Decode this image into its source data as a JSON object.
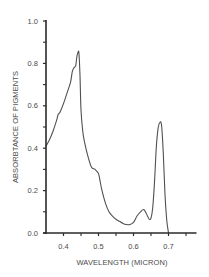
{
  "chart_data": {
    "type": "line",
    "title": "",
    "xlabel": "WAVELENGTH (MICRON)",
    "ylabel": "ABSORBTANCE OF PIGMENTS",
    "xlim": [
      0.35,
      0.78
    ],
    "ylim": [
      0.0,
      1.0
    ],
    "x_ticks": [
      0.4,
      0.5,
      0.6,
      0.7
    ],
    "x_tick_labels": [
      "0.4",
      "0.5",
      "0.6",
      "0.7"
    ],
    "x_minor_ticks": [
      0.45,
      0.55,
      0.65,
      0.75
    ],
    "y_ticks": [
      0.0,
      0.2,
      0.4,
      0.6,
      0.8,
      1.0
    ],
    "y_tick_labels": [
      "0.0",
      "0.2",
      "0.4",
      "0.6",
      "0.8",
      "1.0"
    ],
    "y_minor_ticks": [
      0.1,
      0.3,
      0.5,
      0.7,
      0.9
    ],
    "grid": false,
    "legend": null,
    "series": [
      {
        "name": "Pigment absorbtance",
        "x": [
          0.35,
          0.36,
          0.37,
          0.38,
          0.385,
          0.39,
          0.4,
          0.41,
          0.42,
          0.425,
          0.43,
          0.435,
          0.438,
          0.441,
          0.444,
          0.447,
          0.45,
          0.455,
          0.46,
          0.47,
          0.48,
          0.49,
          0.5,
          0.505,
          0.51,
          0.52,
          0.53,
          0.54,
          0.55,
          0.56,
          0.57,
          0.58,
          0.59,
          0.6,
          0.61,
          0.62,
          0.63,
          0.64,
          0.645,
          0.65,
          0.655,
          0.66,
          0.665,
          0.67,
          0.675,
          0.68,
          0.685,
          0.69,
          0.695,
          0.7
        ],
        "y": [
          0.41,
          0.44,
          0.48,
          0.53,
          0.56,
          0.57,
          0.61,
          0.66,
          0.71,
          0.76,
          0.78,
          0.79,
          0.83,
          0.85,
          0.85,
          0.75,
          0.58,
          0.48,
          0.43,
          0.36,
          0.31,
          0.3,
          0.28,
          0.24,
          0.2,
          0.14,
          0.1,
          0.08,
          0.065,
          0.055,
          0.045,
          0.04,
          0.04,
          0.05,
          0.08,
          0.1,
          0.11,
          0.08,
          0.065,
          0.07,
          0.12,
          0.24,
          0.4,
          0.49,
          0.52,
          0.51,
          0.38,
          0.18,
          0.06,
          0.0
        ]
      }
    ],
    "annotations": [
      {
        "label": "blue peak",
        "x": 0.443,
        "y": 0.85
      },
      {
        "label": "red peak",
        "x": 0.68,
        "y": 0.52
      },
      {
        "label": "shoulder",
        "x": 0.495,
        "y": 0.3
      },
      {
        "label": "minimum",
        "x": 0.585,
        "y": 0.04
      },
      {
        "label": "small peak",
        "x": 0.625,
        "y": 0.11
      }
    ],
    "colors": {
      "line": "#505050",
      "axis": "#2a2a2a",
      "text": "#4a4a4a",
      "background": "#ffffff"
    }
  }
}
